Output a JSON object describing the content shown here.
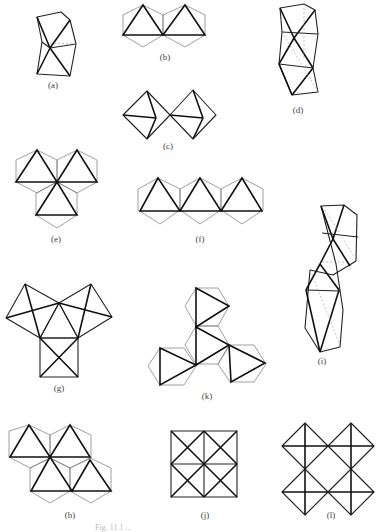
{
  "figure": {
    "panels": [
      {
        "id": "a",
        "label": "(a)",
        "description": "single pair of edge-sharing octahedra (perspective)"
      },
      {
        "id": "b",
        "label": "(b)",
        "description": "two edge-sharing octahedra, face-on"
      },
      {
        "id": "c",
        "label": "(c)",
        "description": "two corner-sharing octahedra"
      },
      {
        "id": "d",
        "label": "(d)",
        "description": "stacked face-sharing octahedra column"
      },
      {
        "id": "e",
        "label": "(e)",
        "description": "three edge-sharing octahedra in a triangle"
      },
      {
        "id": "f",
        "label": "(f)",
        "description": "three edge-sharing octahedra in a row"
      },
      {
        "id": "g",
        "label": "(g)",
        "description": "three corner-sharing octahedra"
      },
      {
        "id": "h",
        "label": "(h)",
        "description": "four edge-sharing octahedra sheet fragment"
      },
      {
        "id": "i",
        "label": "(i)",
        "description": "two face-sharing pairs joined"
      },
      {
        "id": "j",
        "label": "(j)",
        "description": "four edge-sharing octahedra square"
      },
      {
        "id": "k",
        "label": "(k)",
        "description": "three octahedra around a central one"
      },
      {
        "id": "l",
        "label": "(l)",
        "description": "four corner-sharing octahedra square"
      }
    ],
    "caption": "Fig. 11.1 ..."
  }
}
